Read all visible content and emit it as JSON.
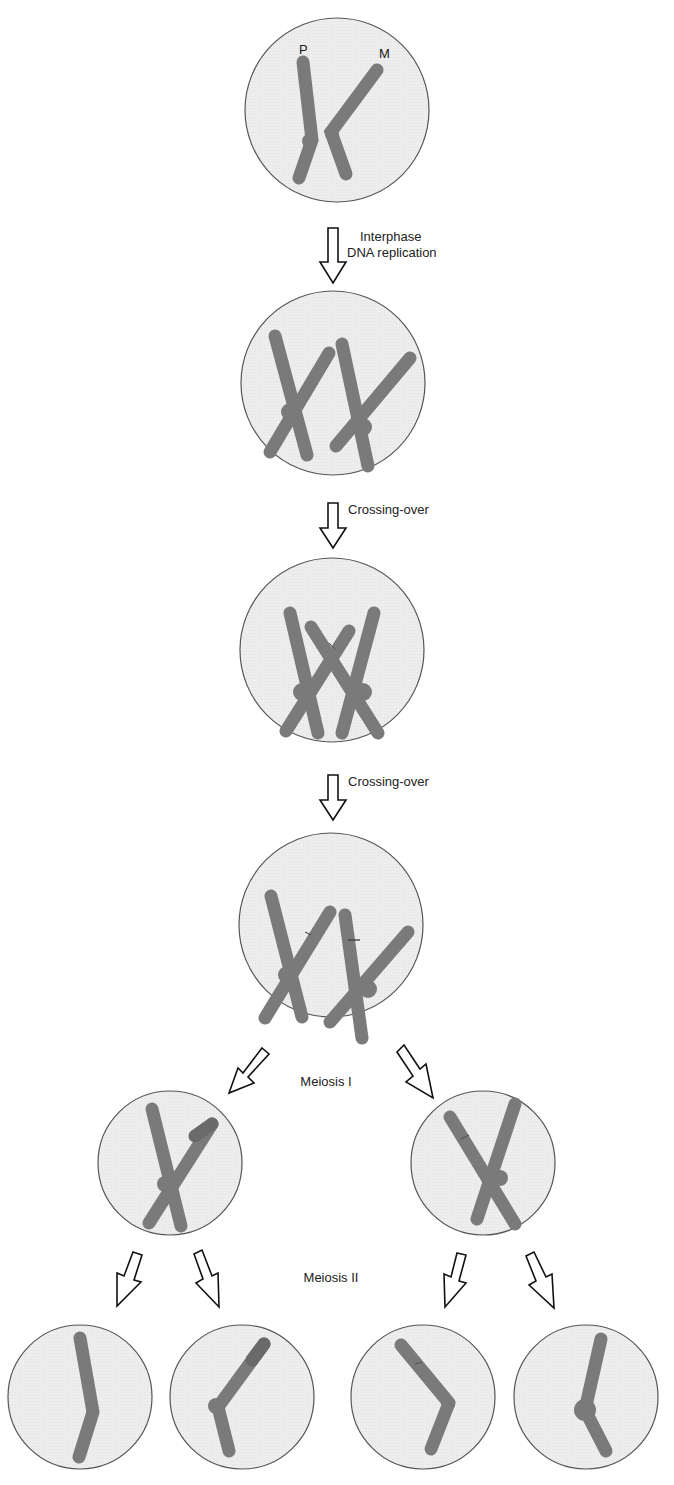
{
  "colors": {
    "background": "#ffffff",
    "cell_fill": "#ececec",
    "cell_stroke": "#555555",
    "chromosome": "#7a7a7a",
    "chromosome_dark": "#6a6a6a",
    "arrow_stroke": "#111111",
    "arrow_fill": "#ffffff"
  },
  "chromosome_labels": {
    "paternal": "P",
    "maternal": "M"
  },
  "stages": {
    "arrow1_label_line1": "Interphase",
    "arrow1_label_line2": "DNA replication",
    "arrow2_label": "Crossing-over",
    "arrow3_label": "Crossing-over",
    "meiosis1_label": "Meiosis I",
    "meiosis2_label": "Meiosis II"
  },
  "cells": [
    {
      "id": "cell-parent",
      "cx": 337,
      "cy": 110,
      "r": 92
    },
    {
      "id": "cell-replicated",
      "cx": 333,
      "cy": 383,
      "r": 92
    },
    {
      "id": "cell-synapsis",
      "cx": 332,
      "cy": 650,
      "r": 92
    },
    {
      "id": "cell-recombined",
      "cx": 331,
      "cy": 925,
      "r": 92
    },
    {
      "id": "cell-meiosis1-left",
      "cx": 170,
      "cy": 1163,
      "r": 72
    },
    {
      "id": "cell-meiosis1-right",
      "cx": 483,
      "cy": 1163,
      "r": 72
    },
    {
      "id": "cell-gamete-1",
      "cx": 80,
      "cy": 1397,
      "r": 72
    },
    {
      "id": "cell-gamete-2",
      "cx": 242,
      "cy": 1397,
      "r": 72
    },
    {
      "id": "cell-gamete-3",
      "cx": 423,
      "cy": 1397,
      "r": 72
    },
    {
      "id": "cell-gamete-4",
      "cx": 586,
      "cy": 1397,
      "r": 72
    }
  ]
}
